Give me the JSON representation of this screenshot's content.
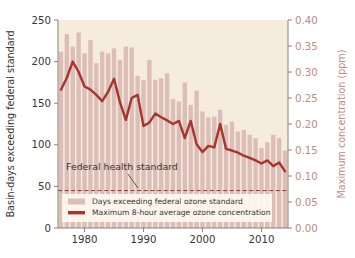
{
  "chart_data": {
    "type": "bar",
    "title": "",
    "subtitle": "",
    "xlabel": "",
    "ylabel": "Basin-days exceeding federal standard",
    "y2label": "Maximum concentration (ppm)",
    "ylim": [
      0,
      250
    ],
    "y2lim": [
      0.0,
      0.4
    ],
    "xlim": [
      1975.5,
      2014.5
    ],
    "grid": false,
    "legend_position": "lower-left-inside",
    "y_ticks": [
      "0",
      "50",
      "100",
      "150",
      "200",
      "250"
    ],
    "y_tick_values": [
      0,
      50,
      100,
      150,
      200,
      250
    ],
    "y2_ticks": [
      "0.00",
      "0.05",
      "0.10",
      "0.15",
      "0.20",
      "0.25",
      "0.30",
      "0.35",
      "0.40"
    ],
    "y2_tick_values": [
      0.0,
      0.05,
      0.1,
      0.15,
      0.2,
      0.25,
      0.3,
      0.35,
      0.4
    ],
    "x_ticks": [
      "1980",
      "1990",
      "2000",
      "2010"
    ],
    "x_tick_values": [
      1980,
      1990,
      2000,
      2010
    ],
    "x": [
      1976,
      1977,
      1978,
      1979,
      1980,
      1981,
      1982,
      1983,
      1984,
      1985,
      1986,
      1987,
      1988,
      1989,
      1990,
      1991,
      1992,
      1993,
      1994,
      1995,
      1996,
      1997,
      1998,
      1999,
      2000,
      2001,
      2002,
      2003,
      2004,
      2005,
      2006,
      2007,
      2008,
      2009,
      2010,
      2011,
      2012,
      2013,
      2014
    ],
    "series": [
      {
        "name": "Days exceeding federal ozone standard",
        "type": "bar",
        "axis": "left",
        "color": "#dcbdb8",
        "units": "basin-days",
        "values": [
          212,
          233,
          218,
          235,
          210,
          226,
          198,
          212,
          210,
          216,
          202,
          218,
          217,
          183,
          178,
          202,
          178,
          180,
          186,
          155,
          152,
          175,
          148,
          165,
          140,
          133,
          134,
          142,
          124,
          128,
          116,
          118,
          112,
          108,
          96,
          103,
          112,
          108,
          93
        ]
      },
      {
        "name": "Maximum 8-hour average ozone concentration",
        "type": "line",
        "axis": "right",
        "color": "#a8342e",
        "units": "ppm",
        "values": [
          0.266,
          0.289,
          0.32,
          0.3,
          0.272,
          0.266,
          0.256,
          0.244,
          0.262,
          0.287,
          0.242,
          0.208,
          0.25,
          0.256,
          0.196,
          0.203,
          0.22,
          0.213,
          0.207,
          0.2,
          0.206,
          0.173,
          0.206,
          0.161,
          0.146,
          0.158,
          0.155,
          0.2,
          0.152,
          0.149,
          0.145,
          0.139,
          0.135,
          0.13,
          0.124,
          0.13,
          0.119,
          0.126,
          0.109
        ]
      }
    ],
    "reference_line": {
      "label": "Federal health standard",
      "axis": "left",
      "value": 45,
      "style": "dashed",
      "color": "#a8342e"
    },
    "legend_entries": [
      {
        "label": "Days exceeding federal ozone standard",
        "marker": "bar-swatch",
        "color": "#dcbdb8"
      },
      {
        "label": "Maximum 8-hour average ozone concentration",
        "marker": "line-swatch",
        "color": "#a8342e"
      }
    ],
    "colors": {
      "plot_background": "#f6ecdd",
      "bar": "#dcbdb8",
      "line": "#a8342e",
      "right_axis_text": "#c08a86",
      "left_axis_text": "#3a3330",
      "axis_line": "#8c8279",
      "legend_background": "#fdf8f1"
    }
  }
}
